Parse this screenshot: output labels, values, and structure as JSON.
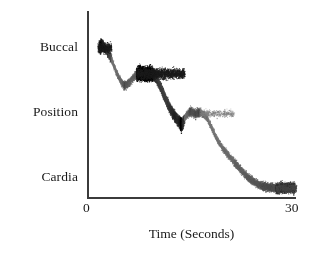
{
  "chart_data": {
    "type": "scatter",
    "title": "",
    "xlabel": "Time (Seconds)",
    "ylabel": "",
    "xlim": [
      0,
      30
    ],
    "ylim": [
      0,
      3
    ],
    "grid": false,
    "legend": null,
    "x_ticks": [
      "0",
      "30"
    ],
    "x_tick_values": [
      0,
      30
    ],
    "y_ticks": [
      "Buccal",
      "Position",
      "Cardia"
    ],
    "y_tick_values": [
      2.62,
      1.33,
      0.05
    ],
    "series": [
      {
        "name": "Electrode position",
        "marker": "dot",
        "color": "#141414",
        "description": "Noisy descending staircase from Buccal to Cardia with three dwell plateaus",
        "x": [
          1.4,
          1.8,
          2.2,
          2.6,
          3.0,
          3.4,
          3.8,
          4.2,
          4.6,
          5.0,
          5.4,
          5.8,
          6.2,
          6.6,
          7.0,
          7.4,
          7.8,
          8.2,
          8.6,
          9.0,
          9.4,
          9.8,
          10.2,
          10.6,
          11.0,
          11.4,
          11.8,
          12.2,
          12.6,
          13.0,
          13.4,
          13.8,
          14.2,
          14.6,
          15.0,
          15.4,
          15.8,
          16.2,
          16.6,
          17.0,
          17.4,
          17.8,
          18.2,
          18.6,
          19.0,
          19.4,
          19.8,
          20.2,
          20.6,
          21.0,
          21.4,
          21.8,
          22.2,
          22.6,
          23.0,
          23.4,
          23.8,
          24.2,
          24.6,
          25.0,
          25.4,
          25.8,
          26.2,
          26.6,
          27.0,
          27.4,
          27.8,
          28.2,
          28.6,
          29.0,
          29.4,
          29.8
        ],
        "y": [
          2.7,
          2.72,
          2.68,
          2.6,
          2.52,
          2.4,
          2.26,
          2.14,
          2.05,
          1.98,
          2.0,
          2.04,
          2.1,
          2.16,
          2.2,
          2.21,
          2.2,
          2.19,
          2.2,
          2.2,
          2.18,
          2.1,
          1.98,
          1.86,
          1.74,
          1.62,
          1.52,
          1.44,
          1.38,
          1.3,
          1.26,
          1.36,
          1.46,
          1.5,
          1.48,
          1.46,
          1.48,
          1.47,
          1.44,
          1.38,
          1.28,
          1.18,
          1.06,
          0.96,
          0.88,
          0.8,
          0.74,
          0.68,
          0.62,
          0.56,
          0.5,
          0.44,
          0.38,
          0.32,
          0.28,
          0.24,
          0.2,
          0.17,
          0.14,
          0.12,
          0.11,
          0.1,
          0.09,
          0.09,
          0.08,
          0.08,
          0.09,
          0.08,
          0.08,
          0.09,
          0.08,
          0.08
        ]
      }
    ],
    "plateaus": [
      {
        "label": "Buccal dwell",
        "x_range": [
          1.2,
          3.2
        ],
        "y_level": 2.68,
        "density": "dense"
      },
      {
        "label": "Upper-mid dwell",
        "x_range": [
          6.8,
          13.8
        ],
        "y_level": 2.2,
        "density": "very-dense"
      },
      {
        "label": "Mid dwell",
        "x_range": [
          16.0,
          21.0
        ],
        "y_level": 1.46,
        "density": "sparse"
      },
      {
        "label": "Cardia dwell",
        "x_range": [
          27.0,
          30.0
        ],
        "y_level": 0.08,
        "density": "medium"
      }
    ]
  },
  "axes": {
    "x_title": "Time (Seconds)",
    "x_ticks": [
      {
        "label": "0",
        "value": 0
      },
      {
        "label": "30",
        "value": 30
      }
    ],
    "y_ticks": [
      {
        "label": "Buccal",
        "value": 2.62
      },
      {
        "label": "Position",
        "value": 1.33
      },
      {
        "label": "Cardia",
        "value": 0.05
      }
    ]
  },
  "style": {
    "axis_color": "#3b3b3b",
    "marker_color": "#141414",
    "background": "#ffffff"
  }
}
